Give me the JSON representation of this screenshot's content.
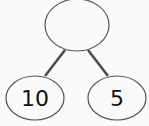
{
  "diagram": {
    "type": "number-bond",
    "whole": {
      "label": ""
    },
    "parts": [
      {
        "label": "10"
      },
      {
        "label": "5"
      }
    ]
  },
  "colors": {
    "background": "#fafafa",
    "outline": "#555555",
    "connector": "#4a4a4a",
    "text": "#111111"
  }
}
